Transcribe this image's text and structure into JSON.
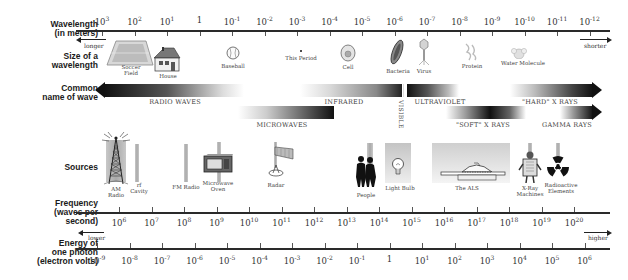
{
  "rows": {
    "wavelength": "Wavelength (in meters)",
    "wavelength_l1": "Wavelength",
    "wavelength_l2": "(in meters)",
    "size_l1": "Size of a",
    "size_l2": "wavelength",
    "common_l1": "Common",
    "common_l2": "name of wave",
    "sources": "Sources",
    "freq_l1": "Frequency",
    "freq_l2": "(waves per",
    "freq_l3": "second)",
    "energy_l1": "Energy of",
    "energy_l2": "one photon",
    "energy_l3": "(electron volts)"
  },
  "wavelength_ticks": [
    {
      "base": "10",
      "exp": "3"
    },
    {
      "base": "10",
      "exp": "2"
    },
    {
      "base": "10",
      "exp": "1"
    },
    {
      "base": "1",
      "exp": ""
    },
    {
      "base": "10",
      "exp": "-1"
    },
    {
      "base": "10",
      "exp": "-2"
    },
    {
      "base": "10",
      "exp": "-3"
    },
    {
      "base": "10",
      "exp": "-4"
    },
    {
      "base": "10",
      "exp": "-5"
    },
    {
      "base": "10",
      "exp": "-6"
    },
    {
      "base": "10",
      "exp": "-7"
    },
    {
      "base": "10",
      "exp": "-8"
    },
    {
      "base": "10",
      "exp": "-9"
    },
    {
      "base": "10",
      "exp": "-10"
    },
    {
      "base": "10",
      "exp": "-11"
    },
    {
      "base": "10",
      "exp": "-12"
    }
  ],
  "direction": {
    "longer": "longer",
    "shorter": "shorter",
    "lower": "lower",
    "higher": "higher"
  },
  "size_examples": {
    "soccer_l1": "Soccer",
    "soccer_l2": "Field",
    "house": "House",
    "baseball": "Baseball",
    "period": "This Period",
    "cell": "Cell",
    "bacteria": "Bacteria",
    "virus": "Virus",
    "protein": "Protein",
    "water": "Water Molecule"
  },
  "waves": {
    "radio": "RADIO WAVES",
    "microwaves": "MICROWAVES",
    "infrared": "INFRARED",
    "visible": "VISIBLE",
    "ultraviolet": "ULTRAVIOLET",
    "soft_xray": "\"SOFT\" X RAYS",
    "hard_xray": "\"HARD\" X RAYS",
    "gamma": "GAMMA RAYS"
  },
  "sources": {
    "am_l1": "AM",
    "am_l2": "Radio",
    "rf_l1": "rf",
    "rf_l2": "Cavity",
    "fm": "FM Radio",
    "mw_l1": "Microwave",
    "mw_l2": "Oven",
    "radar": "Radar",
    "people": "People",
    "bulb": "Light Bulb",
    "als": "The ALS",
    "xray_l1": "X-Ray",
    "xray_l2": "Machines",
    "rad_l1": "Radioactive",
    "rad_l2": "Elements"
  },
  "frequency_ticks": [
    {
      "base": "10",
      "exp": "6"
    },
    {
      "base": "10",
      "exp": "7"
    },
    {
      "base": "10",
      "exp": "8"
    },
    {
      "base": "10",
      "exp": "9"
    },
    {
      "base": "10",
      "exp": "10"
    },
    {
      "base": "10",
      "exp": "11"
    },
    {
      "base": "10",
      "exp": "12"
    },
    {
      "base": "10",
      "exp": "13"
    },
    {
      "base": "10",
      "exp": "14"
    },
    {
      "base": "10",
      "exp": "15"
    },
    {
      "base": "10",
      "exp": "16"
    },
    {
      "base": "10",
      "exp": "17"
    },
    {
      "base": "10",
      "exp": "18"
    },
    {
      "base": "10",
      "exp": "19"
    },
    {
      "base": "10",
      "exp": "20"
    }
  ],
  "energy_ticks": [
    {
      "base": "10",
      "exp": "-9"
    },
    {
      "base": "10",
      "exp": "-8"
    },
    {
      "base": "10",
      "exp": "-7"
    },
    {
      "base": "10",
      "exp": "-6"
    },
    {
      "base": "10",
      "exp": "-5"
    },
    {
      "base": "10",
      "exp": "-4"
    },
    {
      "base": "10",
      "exp": "-3"
    },
    {
      "base": "10",
      "exp": "-2"
    },
    {
      "base": "10",
      "exp": "-1"
    },
    {
      "base": "1",
      "exp": ""
    },
    {
      "base": "10",
      "exp": "1"
    },
    {
      "base": "10",
      "exp": "2"
    },
    {
      "base": "10",
      "exp": "3"
    },
    {
      "base": "10",
      "exp": "4"
    },
    {
      "base": "10",
      "exp": "5"
    },
    {
      "base": "10",
      "exp": "6"
    }
  ]
}
